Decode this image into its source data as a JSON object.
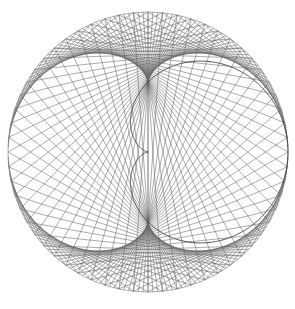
{
  "page": {
    "width": 295,
    "height": 309,
    "background_color": "#ffffff"
  },
  "caption": {
    "text": "",
    "color": "#b9b9bd",
    "clipped_by_top_edge": true,
    "note": "illegible"
  },
  "figure": {
    "name": "envelope-string-figure",
    "alt_text": "",
    "stroke_color": "#666666",
    "accent_stroke_color": "#3a3a3a",
    "background_color": "#ffffff",
    "center_x": 148,
    "center_y": 152,
    "outer_radius": 140,
    "cusp_x": 147,
    "cusp_y": 126,
    "bounds": {
      "left": 8,
      "top": 11,
      "right": 288,
      "bottom": 295
    }
  },
  "chart_data": {
    "type": "line",
    "title": "",
    "subtitle": "",
    "xlabel": "",
    "ylabel": "",
    "grid": false,
    "legend_position": "none",
    "xlim": [
      -1.05,
      1.05
    ],
    "ylim": [
      -1.05,
      1.05
    ],
    "xtick_labels": [],
    "ytick_labels": [],
    "annotations": [],
    "construction": {
      "base_curve": "circle",
      "base_radius": 1.0,
      "chord_count": 180,
      "multiplier_k": 3,
      "theta_start_deg": 0,
      "theta_end_deg": 360,
      "theta_step_deg": 2,
      "envelope_curves": [
        "circle",
        "cardioid"
      ],
      "cusp_angle_deg": 90
    },
    "series": [
      {
        "name": "chords",
        "values": [
          180
        ]
      },
      {
        "name": "outer-envelope-radius",
        "values": [
          1.0
        ]
      },
      {
        "name": "inner-envelope-cardioid-scale",
        "values": [
          0.5
        ]
      }
    ]
  }
}
